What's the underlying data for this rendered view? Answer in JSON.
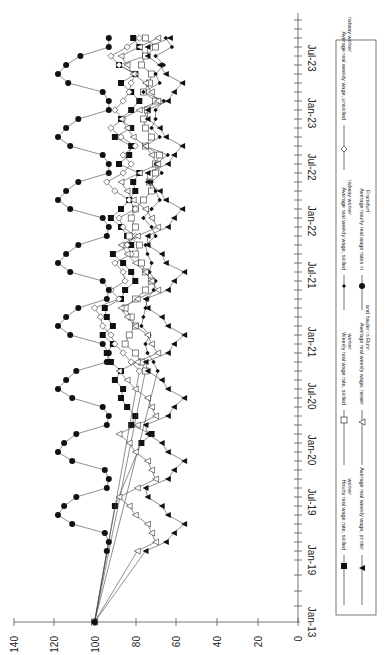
{
  "chart_data": {
    "type": "line",
    "orientation": "rotated-90-clockwise",
    "title": "",
    "xlabel": "",
    "ylabel": "",
    "ylim": [
      0,
      140
    ],
    "y_ticks": [
      0,
      20,
      40,
      60,
      80,
      100,
      120,
      140
    ],
    "x_tick_labels": [
      "Jan-13",
      "Jan-19",
      "Jul-19",
      "Jan-20",
      "Jul-20",
      "Jan-21",
      "Jul-21",
      "Jan-22",
      "Jul-22",
      "Jan-23",
      "Jul-23"
    ],
    "legend_position": "right (rotated)",
    "grid": false,
    "x": [
      "Jan-13",
      "Jan-19",
      "Feb-19",
      "Mar-19",
      "Apr-19",
      "May-19",
      "Jun-19",
      "Jul-19",
      "Aug-19",
      "Sep-19",
      "Oct-19",
      "Nov-19",
      "Dec-19",
      "Jan-20",
      "Feb-20",
      "Mar-20",
      "Apr-20",
      "May-20",
      "Jun-20",
      "Jul-20",
      "Aug-20",
      "Sep-20",
      "Oct-20",
      "Nov-20",
      "Dec-20",
      "Jan-21",
      "Feb-21",
      "Mar-21",
      "Apr-21",
      "May-21",
      "Jun-21",
      "Jul-21",
      "Aug-21",
      "Sep-21",
      "Oct-21",
      "Nov-21",
      "Dec-21",
      "Jan-22",
      "Feb-22",
      "Mar-22",
      "Apr-22",
      "May-22",
      "Jun-22",
      "Jul-22",
      "Aug-22",
      "Sep-22",
      "Oct-22",
      "Nov-22",
      "Dec-22",
      "Jan-23",
      "Feb-23",
      "Mar-23",
      "Apr-23",
      "May-23",
      "Jun-23",
      "Jul-23",
      "Aug-23",
      "Sep-23",
      "Oct-23",
      "Nov-23"
    ],
    "series": [
      {
        "name": "Hourly real wage rate, skilled worker",
        "marker": "filled-square",
        "values": [
          100,
          null,
          null,
          null,
          null,
          null,
          null,
          90,
          null,
          null,
          null,
          null,
          null,
          null,
          77,
          72,
          82,
          80,
          84,
          87,
          86,
          90,
          87,
          92,
          94,
          91,
          96,
          91,
          94,
          95,
          87,
          85,
          80,
          82,
          86,
          91,
          82,
          84,
          87,
          92,
          87,
          83,
          80,
          81,
          78,
          88,
          83,
          82,
          90,
          82,
          87,
          82,
          78,
          82,
          87,
          80,
          88,
          75,
          78,
          81
        ]
      },
      {
        "name": "Weekly real wage rate, skilled worker",
        "marker": "open-square",
        "values": [
          100,
          null,
          null,
          null,
          null,
          null,
          null,
          null,
          null,
          null,
          null,
          null,
          null,
          null,
          null,
          null,
          null,
          null,
          null,
          null,
          null,
          null,
          75,
          77,
          80,
          85,
          83,
          80,
          82,
          85,
          80,
          75,
          72,
          75,
          77,
          80,
          78,
          83,
          80,
          82,
          80,
          76,
          72,
          73,
          70,
          70,
          68,
          75,
          72,
          75,
          76,
          74,
          70,
          76,
          73,
          72,
          77,
          75,
          70,
          75
        ]
      },
      {
        "name": "Average real weekly wage, unskilled railway worker",
        "marker": "open-diamond",
        "values": [
          100,
          null,
          null,
          null,
          null,
          null,
          null,
          null,
          null,
          null,
          null,
          null,
          null,
          null,
          null,
          null,
          null,
          null,
          null,
          null,
          null,
          null,
          78,
          82,
          86,
          90,
          92,
          96,
          97,
          100,
          88,
          92,
          85,
          86,
          90,
          82,
          84,
          80,
          86,
          88,
          80,
          83,
          90,
          94,
          86,
          82,
          86,
          80,
          87,
          92,
          86,
          90,
          86,
          83,
          82,
          80,
          88,
          92,
          84,
          78
        ]
      },
      {
        "name": "Average real weekly wage, skilled railway worker",
        "marker": "small-filled-diamond",
        "values": [
          100,
          null,
          null,
          null,
          null,
          null,
          null,
          null,
          null,
          null,
          null,
          null,
          null,
          null,
          null,
          null,
          null,
          null,
          null,
          null,
          null,
          null,
          69,
          71,
          74,
          75,
          73,
          77,
          76,
          75,
          74,
          71,
          70,
          73,
          72,
          74,
          75,
          70,
          72,
          76,
          72,
          68,
          70,
          72,
          67,
          70,
          64,
          75,
          68,
          72,
          70,
          70,
          66,
          76,
          68,
          70,
          66,
          70,
          62,
          65
        ]
      },
      {
        "name": "Average real weekly wage, printer",
        "marker": "filled-triangle",
        "values": [
          100,
          null,
          null,
          null,
          null,
          null,
          null,
          null,
          null,
          null,
          null,
          null,
          null,
          null,
          null,
          null,
          null,
          null,
          null,
          null,
          null,
          null,
          null,
          null,
          null,
          null,
          null,
          null,
          null,
          null,
          null,
          null,
          null,
          null,
          null,
          null,
          null,
          null,
          null,
          null,
          null,
          null,
          null,
          null,
          null,
          null,
          null,
          null,
          null,
          null,
          null,
          null,
          null,
          null,
          null,
          null,
          null,
          null,
          null,
          null
        ]
      },
      {
        "name": "Average real weekly wage, hewer and hauler in Ruhr",
        "marker": "open-triangle",
        "values": [
          100,
          null,
          null,
          null,
          null,
          null,
          null,
          null,
          null,
          null,
          null,
          null,
          null,
          null,
          null,
          null,
          null,
          null,
          null,
          null,
          null,
          null,
          null,
          null,
          null,
          null,
          null,
          null,
          null,
          null,
          null,
          null,
          null,
          null,
          null,
          null,
          null,
          null,
          null,
          null,
          null,
          null,
          null,
          null,
          null,
          null,
          null,
          null,
          null,
          null,
          null,
          null,
          null,
          null,
          null,
          null,
          null,
          null,
          null,
          null
        ]
      },
      {
        "name": "Average hourly real wage rates in Frankfurt",
        "marker": "filled-circle",
        "values": [
          100,
          null,
          null,
          null,
          null,
          null,
          null,
          null,
          null,
          null,
          null,
          null,
          null,
          null,
          null,
          null,
          null,
          null,
          null,
          null,
          null,
          null,
          null,
          null,
          null,
          null,
          null,
          null,
          null,
          null,
          null,
          null,
          null,
          null,
          null,
          null,
          null,
          null,
          null,
          null,
          null,
          null,
          null,
          null,
          null,
          null,
          null,
          null,
          null,
          null,
          null,
          null,
          null,
          null,
          null,
          null,
          null,
          null,
          null,
          null
        ]
      }
    ]
  },
  "axis": {
    "value_ticks": [
      "140",
      "120",
      "100",
      "80",
      "60",
      "40",
      "20",
      "0"
    ],
    "date_ticks": [
      "Jan-13",
      "Jan-19",
      "Jul-19",
      "Jan-20",
      "Jul-20",
      "Jan-21",
      "Jul-21",
      "Jan-22",
      "Jul-22",
      "Jan-23",
      "Jul-23"
    ]
  },
  "legend": {
    "items": [
      {
        "label_1": "Hourly real wage rate, skilled",
        "label_2": "worker"
      },
      {
        "label_1": "Weekly real wage rate, skilled",
        "label_2": "worker"
      },
      {
        "label_1": "Average real weekly wage, unskilled",
        "label_2": "railway worker"
      },
      {
        "label_1": "Average real weekly wage, printer",
        "label_2": ""
      },
      {
        "label_1": "Average real weekly wage, hewer",
        "label_2": "and hauler in Ruhr"
      },
      {
        "label_1": "Average real weekly wage, skilled",
        "label_2": "railway worker"
      },
      {
        "label_1": "Average hourly real wage rates in",
        "label_2": "Frankfurt"
      }
    ]
  }
}
